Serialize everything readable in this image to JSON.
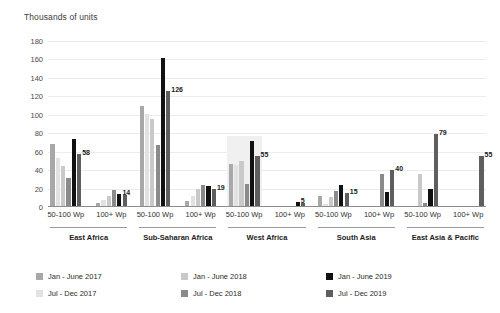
{
  "chart_data": {
    "type": "bar",
    "title": "Thousands of units",
    "ylabel": "Thousands of units",
    "xlabel": "",
    "ylim": [
      0,
      180
    ],
    "yticks": [
      0,
      20,
      40,
      60,
      80,
      100,
      120,
      140,
      160,
      180
    ],
    "grid": true,
    "legend_position": "bottom-left",
    "series": [
      {
        "name": "Jan - June 2017",
        "color": "#a8a8a8"
      },
      {
        "name": "Jul - Dec 2017",
        "color": "#e2e2e2"
      },
      {
        "name": "Jan - June 2018",
        "color": "#c9c9c9"
      },
      {
        "name": "Jul - Dec 2018",
        "color": "#8a8a8a"
      },
      {
        "name": "Jan - June 2019",
        "color": "#111111"
      },
      {
        "name": "Jul - Dec 2019",
        "color": "#5e5e5e"
      }
    ],
    "groups": [
      {
        "region": "East Africa",
        "subgroups": [
          {
            "label": "50-100 Wp",
            "highlight": false,
            "values": [
              68,
              53,
              45,
              31,
              74,
              58
            ],
            "annotations": [
              null,
              null,
              null,
              null,
              null,
              "58"
            ]
          },
          {
            "label": "100+ Wp",
            "highlight": false,
            "values": [
              4,
              8,
              12,
              18,
              14,
              13
            ],
            "annotations": [
              null,
              null,
              null,
              null,
              "14",
              null
            ]
          }
        ]
      },
      {
        "region": "Sub-Saharan Africa",
        "subgroups": [
          {
            "label": "50-100 Wp",
            "highlight": false,
            "values": [
              110,
              101,
              95,
              67,
              162,
              126
            ],
            "annotations": [
              null,
              null,
              null,
              null,
              null,
              "126"
            ]
          },
          {
            "label": "100+ Wp",
            "highlight": false,
            "values": [
              7,
              12,
              19,
              24,
              23,
              19
            ],
            "annotations": [
              null,
              null,
              null,
              null,
              null,
              "19"
            ]
          }
        ]
      },
      {
        "region": "West Africa",
        "highlight": true,
        "subgroups": [
          {
            "label": "50-100 Wp",
            "highlight": true,
            "values": [
              47,
              46,
              50,
              25,
              72,
              55
            ],
            "annotations": [
              null,
              null,
              null,
              null,
              null,
              "55"
            ]
          },
          {
            "label": "100+ Wp",
            "highlight": false,
            "values": [
              0,
              0,
              0,
              0,
              5,
              4
            ],
            "annotations": [
              null,
              null,
              null,
              null,
              "5",
              null
            ]
          }
        ]
      },
      {
        "region": "South Asia",
        "subgroups": [
          {
            "label": "50-100 Wp",
            "highlight": false,
            "values": [
              12,
              3,
              11,
              17,
              24,
              15
            ],
            "annotations": [
              null,
              null,
              null,
              null,
              null,
              "15"
            ]
          },
          {
            "label": "100+ Wp",
            "highlight": false,
            "values": [
              0,
              0,
              0,
              36,
              16,
              40
            ],
            "annotations": [
              null,
              null,
              null,
              null,
              null,
              "40"
            ]
          }
        ]
      },
      {
        "region": "East Asia & Pacific",
        "subgroups": [
          {
            "label": "50-100 Wp",
            "highlight": false,
            "values": [
              0,
              0,
              36,
              4,
              19,
              79
            ],
            "annotations": [
              null,
              null,
              null,
              null,
              null,
              "79"
            ]
          },
          {
            "label": "100+ Wp",
            "highlight": false,
            "values": [
              0,
              0,
              0,
              0,
              0,
              55
            ],
            "annotations": [
              null,
              null,
              null,
              null,
              null,
              "55"
            ]
          }
        ]
      }
    ]
  }
}
